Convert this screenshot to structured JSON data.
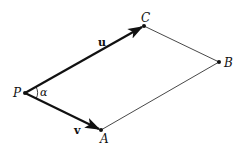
{
  "diagram": {
    "type": "parallelogram-vectors",
    "points": {
      "P": {
        "label": "P",
        "x": 25,
        "y": 93
      },
      "A": {
        "label": "A",
        "x": 101,
        "y": 130
      },
      "B": {
        "label": "B",
        "x": 219,
        "y": 62
      },
      "C": {
        "label": "C",
        "x": 144,
        "y": 26
      }
    },
    "vectors": [
      {
        "name": "u",
        "label": "u",
        "from": "P",
        "to": "A"
      },
      {
        "name": "v",
        "label": "v",
        "from": "P",
        "to": "C"
      }
    ],
    "edges": [
      {
        "from": "C",
        "to": "B"
      },
      {
        "from": "A",
        "to": "B"
      }
    ],
    "angle": {
      "label": "α",
      "at": "P",
      "between": [
        "u",
        "v"
      ]
    },
    "colors": {
      "stroke": "#111111",
      "thin_stroke": "#333333",
      "background": "#ffffff"
    }
  }
}
